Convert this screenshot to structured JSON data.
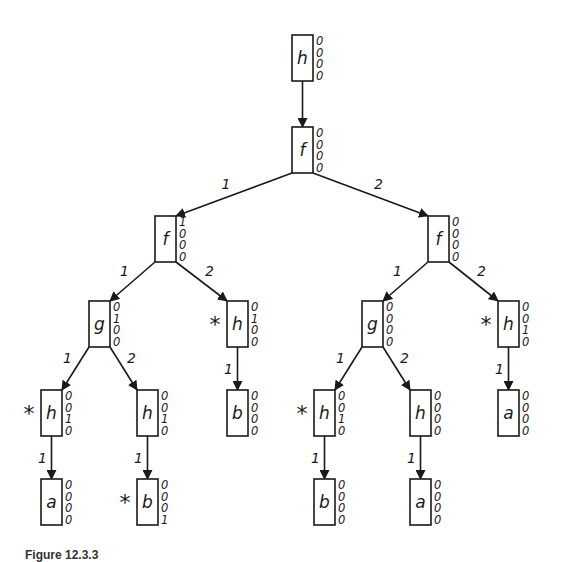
{
  "figure": {
    "caption": "Figure 12.3.3",
    "nodes": [
      {
        "id": "n0",
        "label": "h",
        "bits": [
          "0",
          "0",
          "0",
          "0"
        ],
        "marked": false,
        "x": 292,
        "y": 35
      },
      {
        "id": "n1",
        "label": "f",
        "bits": [
          "0",
          "0",
          "0",
          "0"
        ],
        "marked": false,
        "x": 292,
        "y": 127
      },
      {
        "id": "n2",
        "label": "f",
        "bits": [
          "1",
          "0",
          "0",
          "0"
        ],
        "marked": false,
        "x": 155,
        "y": 216
      },
      {
        "id": "n3",
        "label": "f",
        "bits": [
          "0",
          "0",
          "0",
          "0"
        ],
        "marked": false,
        "x": 428,
        "y": 216
      },
      {
        "id": "n4",
        "label": "g",
        "bits": [
          "0",
          "1",
          "0",
          "0"
        ],
        "marked": false,
        "x": 89,
        "y": 301
      },
      {
        "id": "n5",
        "label": "h",
        "bits": [
          "0",
          "1",
          "0",
          "0"
        ],
        "marked": true,
        "x": 227,
        "y": 301
      },
      {
        "id": "n6",
        "label": "g",
        "bits": [
          "0",
          "0",
          "0",
          "0"
        ],
        "marked": false,
        "x": 362,
        "y": 301
      },
      {
        "id": "n7",
        "label": "h",
        "bits": [
          "0",
          "0",
          "1",
          "0"
        ],
        "marked": true,
        "x": 498,
        "y": 301
      },
      {
        "id": "n8",
        "label": "h",
        "bits": [
          "0",
          "0",
          "1",
          "0"
        ],
        "marked": true,
        "x": 41,
        "y": 390
      },
      {
        "id": "n9",
        "label": "h",
        "bits": [
          "0",
          "0",
          "1",
          "0"
        ],
        "marked": false,
        "x": 137,
        "y": 390
      },
      {
        "id": "n10",
        "label": "b",
        "bits": [
          "0",
          "0",
          "0",
          "0"
        ],
        "marked": false,
        "x": 227,
        "y": 390
      },
      {
        "id": "n11",
        "label": "h",
        "bits": [
          "0",
          "0",
          "1",
          "0"
        ],
        "marked": true,
        "x": 314,
        "y": 390
      },
      {
        "id": "n12",
        "label": "h",
        "bits": [
          "0",
          "0",
          "0",
          "0"
        ],
        "marked": false,
        "x": 410,
        "y": 390
      },
      {
        "id": "n13",
        "label": "a",
        "bits": [
          "0",
          "0",
          "0",
          "0"
        ],
        "marked": false,
        "x": 498,
        "y": 390
      },
      {
        "id": "n14",
        "label": "a",
        "bits": [
          "0",
          "0",
          "0",
          "0"
        ],
        "marked": false,
        "x": 41,
        "y": 479
      },
      {
        "id": "n15",
        "label": "b",
        "bits": [
          "0",
          "0",
          "0",
          "1"
        ],
        "marked": true,
        "x": 137,
        "y": 479
      },
      {
        "id": "n16",
        "label": "b",
        "bits": [
          "0",
          "0",
          "0",
          "0"
        ],
        "marked": false,
        "x": 314,
        "y": 479
      },
      {
        "id": "n17",
        "label": "a",
        "bits": [
          "0",
          "0",
          "0",
          "0"
        ],
        "marked": false,
        "x": 410,
        "y": 479
      }
    ],
    "edges": [
      {
        "from": "n0",
        "to": "n1",
        "label": ""
      },
      {
        "from": "n1",
        "to": "n2",
        "label": "1"
      },
      {
        "from": "n1",
        "to": "n3",
        "label": "2"
      },
      {
        "from": "n2",
        "to": "n4",
        "label": "1"
      },
      {
        "from": "n2",
        "to": "n5",
        "label": "2"
      },
      {
        "from": "n3",
        "to": "n6",
        "label": "1"
      },
      {
        "from": "n3",
        "to": "n7",
        "label": "2"
      },
      {
        "from": "n4",
        "to": "n8",
        "label": "1"
      },
      {
        "from": "n4",
        "to": "n9",
        "label": "2"
      },
      {
        "from": "n5",
        "to": "n10",
        "label": "1"
      },
      {
        "from": "n6",
        "to": "n11",
        "label": "1"
      },
      {
        "from": "n6",
        "to": "n12",
        "label": "2"
      },
      {
        "from": "n7",
        "to": "n13",
        "label": "1"
      },
      {
        "from": "n8",
        "to": "n14",
        "label": "1"
      },
      {
        "from": "n9",
        "to": "n15",
        "label": "1"
      },
      {
        "from": "n11",
        "to": "n16",
        "label": "1"
      },
      {
        "from": "n12",
        "to": "n17",
        "label": "1"
      }
    ],
    "mark_symbol": "*",
    "node_width": 21,
    "node_height": 46,
    "line_color": "#1a1a1a"
  }
}
